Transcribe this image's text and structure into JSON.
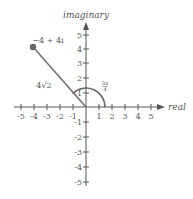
{
  "diagram": {
    "axes": {
      "x_label": "real",
      "y_label": "imaginary",
      "x_ticks": [
        "-5",
        "-4",
        "-3",
        "-2",
        "-1",
        "1",
        "2",
        "3",
        "4",
        "5"
      ],
      "y_ticks": [
        "5",
        "4",
        "3",
        "2",
        "1",
        "-1",
        "-2",
        "-3",
        "-4",
        "-5"
      ]
    },
    "point_label": "−4 + 4i",
    "modulus_label": "4√2",
    "angle_label_num": "3π",
    "angle_label_den": "4",
    "colors": {
      "axis": "#555555",
      "segment": "#777777",
      "point": "#666666"
    }
  }
}
